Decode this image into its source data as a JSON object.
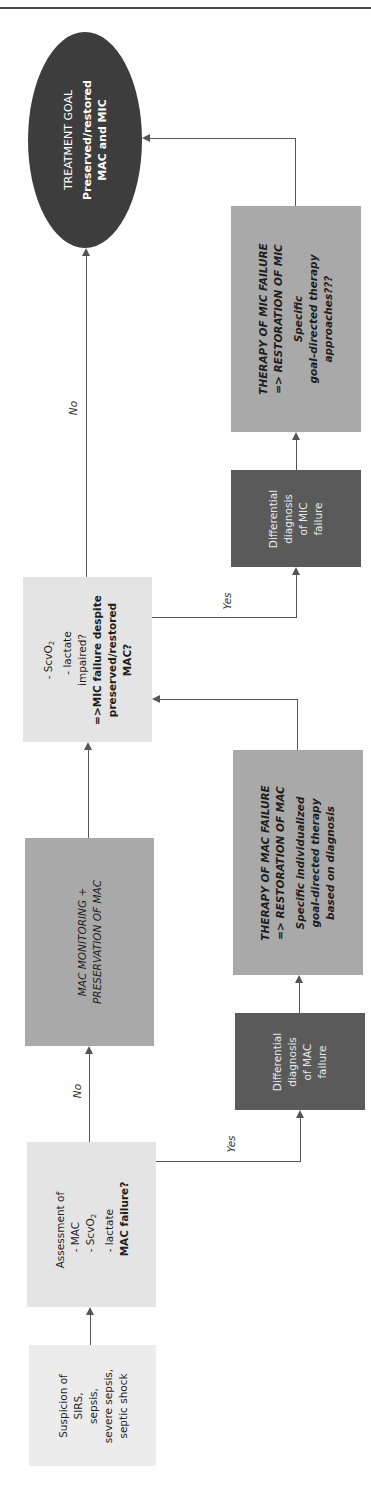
{
  "diagram": {
    "orientation": "rotated-90-counterclockwise",
    "colors": {
      "rule": "#4a4a4a",
      "goal_ellipse": "#3d3d3d",
      "assessment_box": "#e4e4e4",
      "start_box": "#ececec",
      "therapy_box": "#a9a9a9",
      "differential_box": "#5a5a5a",
      "connector": "#555555"
    },
    "nodes": {
      "start": {
        "lines": [
          "Suspicion of",
          "SIRS,",
          "sepsis,",
          "severe sepsis,",
          "septic shock"
        ]
      },
      "assessment_mac": {
        "lines": [
          "Assessment of",
          "- MAC",
          "- ScvO",
          "- lactate"
        ],
        "sub_o2": "2",
        "question": "MAC failure?"
      },
      "mac_monitoring": {
        "lines": [
          "MAC MONITORING +",
          "PRESERVATION OF MAC"
        ]
      },
      "mac_differential": {
        "lines": [
          "Differential",
          "diagnosis",
          "of MAC",
          "failure"
        ]
      },
      "mac_therapy": {
        "title_lines": [
          "THERAPY OF MAC FAILURE",
          "=> RESTORATION OF MAC"
        ],
        "body_lines": [
          "Specific individualized",
          "goal-directed therapy",
          "based on diagnosis"
        ]
      },
      "assessment_mic": {
        "lines": [
          "- ScvO",
          "- lactate",
          "impaired?"
        ],
        "sub_o2": "2",
        "question_lines": [
          "=>MIC failure despite",
          "preserved/restored",
          "MAC?"
        ]
      },
      "mic_differential": {
        "lines": [
          "Differential",
          "diagnosis",
          "of MIC",
          "failure"
        ]
      },
      "mic_therapy": {
        "title_lines": [
          "THERAPY OF MIC FAILURE",
          "=> RESTORATION OF MIC"
        ],
        "body_lines": [
          "Specific",
          "goal-directed therapy",
          "approaches???"
        ]
      },
      "goal": {
        "title": "TREATMENT GOAL",
        "body_lines": [
          "Preserved/restored",
          "MAC and MIC"
        ]
      }
    },
    "edge_labels": {
      "mac_no": "No",
      "mac_yes": "Yes",
      "mic_no": "No",
      "mic_yes": "Yes"
    }
  }
}
